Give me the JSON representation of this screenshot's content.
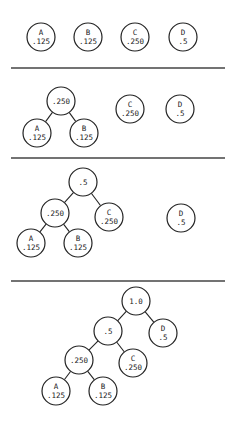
{
  "colors": {
    "stroke": "#222222",
    "background": "#ffffff"
  },
  "node_radius": 14,
  "separators": [
    {
      "y": 68,
      "x1": 11,
      "x2": 225
    },
    {
      "y": 158,
      "x1": 11,
      "x2": 225
    },
    {
      "y": 281,
      "x1": 11,
      "x2": 225
    }
  ],
  "panels": [
    {
      "step": 1,
      "nodes": [
        {
          "id": "A",
          "symbol": "A",
          "weight": ".125",
          "cx": 41,
          "cy": 37
        },
        {
          "id": "B",
          "symbol": "B",
          "weight": ".125",
          "cx": 88,
          "cy": 37
        },
        {
          "id": "C",
          "symbol": "C",
          "weight": ".250",
          "cx": 135,
          "cy": 37
        },
        {
          "id": "D",
          "symbol": "D",
          "weight": ".5",
          "cx": 183,
          "cy": 37
        }
      ],
      "edges": []
    },
    {
      "step": 2,
      "nodes": [
        {
          "id": "AB",
          "symbol": "",
          "weight": ".250",
          "cx": 61,
          "cy": 101
        },
        {
          "id": "A",
          "symbol": "A",
          "weight": ".125",
          "cx": 37,
          "cy": 133
        },
        {
          "id": "B",
          "symbol": "B",
          "weight": ".125",
          "cx": 84,
          "cy": 133
        },
        {
          "id": "C",
          "symbol": "C",
          "weight": ".250",
          "cx": 130,
          "cy": 109
        },
        {
          "id": "D",
          "symbol": "D",
          "weight": ".5",
          "cx": 180,
          "cy": 109
        }
      ],
      "edges": [
        [
          "AB",
          "A"
        ],
        [
          "AB",
          "B"
        ]
      ]
    },
    {
      "step": 3,
      "nodes": [
        {
          "id": "ABC",
          "symbol": "",
          "weight": ".5",
          "cx": 83,
          "cy": 182
        },
        {
          "id": "AB",
          "symbol": "",
          "weight": ".250",
          "cx": 55,
          "cy": 213
        },
        {
          "id": "C",
          "symbol": "C",
          "weight": ".250",
          "cx": 109,
          "cy": 217
        },
        {
          "id": "A",
          "symbol": "A",
          "weight": ".125",
          "cx": 31,
          "cy": 243
        },
        {
          "id": "B",
          "symbol": "B",
          "weight": ".125",
          "cx": 78,
          "cy": 243
        },
        {
          "id": "D",
          "symbol": "D",
          "weight": ".5",
          "cx": 181,
          "cy": 218
        }
      ],
      "edges": [
        [
          "ABC",
          "AB"
        ],
        [
          "ABC",
          "C"
        ],
        [
          "AB",
          "A"
        ],
        [
          "AB",
          "B"
        ]
      ]
    },
    {
      "step": 4,
      "nodes": [
        {
          "id": "ROOT",
          "symbol": "",
          "weight": "1.0",
          "cx": 136,
          "cy": 301
        },
        {
          "id": "ABC",
          "symbol": "",
          "weight": ".5",
          "cx": 108,
          "cy": 331
        },
        {
          "id": "D",
          "symbol": "D",
          "weight": ".5",
          "cx": 163,
          "cy": 333
        },
        {
          "id": "AB",
          "symbol": "",
          "weight": ".250",
          "cx": 79,
          "cy": 360
        },
        {
          "id": "C",
          "symbol": "C",
          "weight": ".250",
          "cx": 133,
          "cy": 363
        },
        {
          "id": "A",
          "symbol": "A",
          "weight": ".125",
          "cx": 56,
          "cy": 391
        },
        {
          "id": "B",
          "symbol": "B",
          "weight": ".125",
          "cx": 103,
          "cy": 391
        }
      ],
      "edges": [
        [
          "ROOT",
          "ABC"
        ],
        [
          "ROOT",
          "D"
        ],
        [
          "ABC",
          "AB"
        ],
        [
          "ABC",
          "C"
        ],
        [
          "AB",
          "A"
        ],
        [
          "AB",
          "B"
        ]
      ]
    }
  ]
}
